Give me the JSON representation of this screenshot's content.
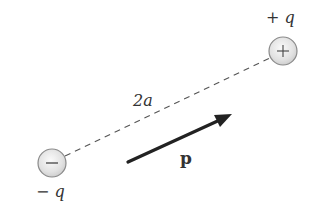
{
  "diagram": {
    "positive_charge": {
      "sign": "+",
      "label": "+ q",
      "center": [
        283,
        51
      ],
      "radius": 14
    },
    "negative_charge": {
      "sign": "−",
      "label": "− q",
      "center": [
        52,
        163
      ],
      "radius": 14
    },
    "separation_label": "2a",
    "dipole_moment_label": "p",
    "colors": {
      "line": "#555555",
      "arrow": "#222222",
      "charge_fill": "#e6e6e6",
      "charge_stroke": "#8a8a8a",
      "text": "#333333"
    }
  }
}
